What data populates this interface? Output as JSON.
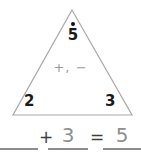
{
  "worksheet": {
    "type": "fact-family-triangle",
    "triangle": {
      "operators_label": "+, −",
      "whole_dot": "dot-marker",
      "top_value": "5",
      "left_value": "2",
      "right_value": "3"
    },
    "equation": {
      "addend1": "",
      "plus_operator": "+",
      "addend2": "3",
      "equals_operator": "=",
      "sum": "5"
    },
    "colors": {
      "triangle_stroke": "#a8a8a8",
      "vertex_text": "#1a1a1a",
      "operator_hint": "#9a9a9a",
      "blank_rule": "#8d8d8d",
      "prefilled_number": "#8f8f8f",
      "equation_operator": "#3d3d3d",
      "background": "#ffffff"
    }
  }
}
